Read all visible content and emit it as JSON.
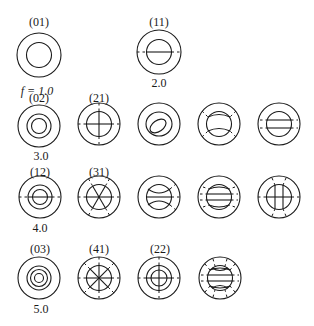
{
  "figure": {
    "frequency_prefix": "f = ",
    "modes": [
      {
        "id": "01",
        "label": "(01)",
        "freq": "1.0",
        "row": 0,
        "col": 0
      },
      {
        "id": "11",
        "label": "(11)",
        "freq": "2.0",
        "row": 0,
        "col": 2
      },
      {
        "id": "02",
        "label": "(02)",
        "freq": "3.0",
        "row": 1,
        "col": 0
      },
      {
        "id": "21",
        "label": "(21)",
        "freq": "",
        "row": 1,
        "col": 1
      },
      {
        "id": "r1c2",
        "label": "",
        "freq": "",
        "row": 1,
        "col": 2
      },
      {
        "id": "r1c3",
        "label": "",
        "freq": "",
        "row": 1,
        "col": 3
      },
      {
        "id": "r1c4",
        "label": "",
        "freq": "",
        "row": 1,
        "col": 4
      },
      {
        "id": "12",
        "label": "(12)",
        "freq": "4.0",
        "row": 2,
        "col": 0
      },
      {
        "id": "31",
        "label": "(31)",
        "freq": "",
        "row": 2,
        "col": 1
      },
      {
        "id": "r2c2",
        "label": "",
        "freq": "",
        "row": 2,
        "col": 2
      },
      {
        "id": "r2c3",
        "label": "",
        "freq": "",
        "row": 2,
        "col": 3
      },
      {
        "id": "r2c4",
        "label": "",
        "freq": "",
        "row": 2,
        "col": 4
      },
      {
        "id": "03",
        "label": "(03)",
        "freq": "5.0",
        "row": 3,
        "col": 0
      },
      {
        "id": "41",
        "label": "(41)",
        "freq": "",
        "row": 3,
        "col": 1
      },
      {
        "id": "22",
        "label": "(22)",
        "freq": "",
        "row": 3,
        "col": 2
      },
      {
        "id": "r3c3",
        "label": "",
        "freq": "",
        "row": 3,
        "col": 3
      }
    ]
  },
  "labels": {
    "m01": "(01)",
    "m11": "(11)",
    "m02": "(02)",
    "m21": "(21)",
    "m12": "(12)",
    "m31": "(31)",
    "m03": "(03)",
    "m41": "(41)",
    "m22": "(22)",
    "f1": "f = 1.0",
    "f2": "2.0",
    "f3": "3.0",
    "f4": "4.0",
    "f5": "5.0"
  }
}
